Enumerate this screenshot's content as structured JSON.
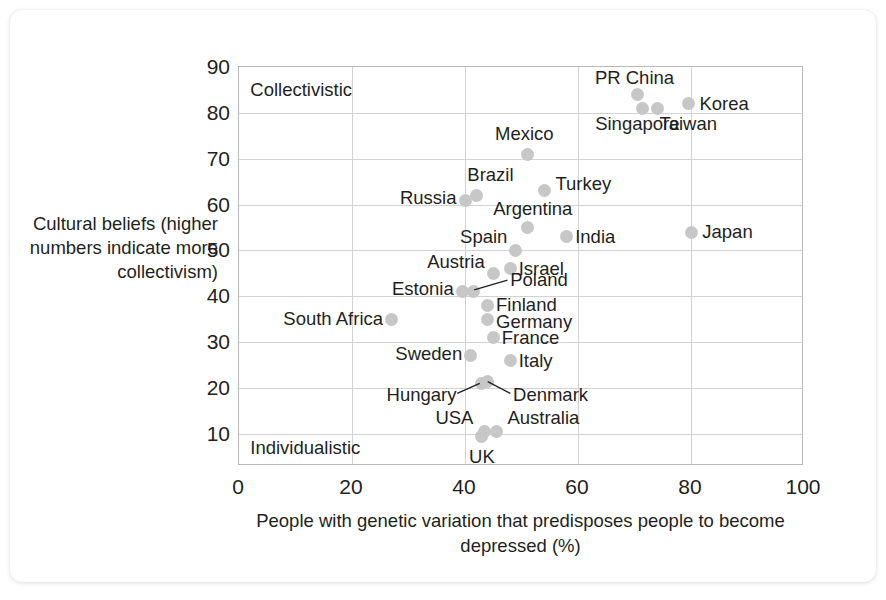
{
  "chart_data": {
    "type": "scatter",
    "title": "",
    "xlabel": "People with genetic variation that predisposes people to become depressed (%)",
    "ylabel": "Cultural beliefs (higher numbers indicate more collectivism)",
    "xlim": [
      0,
      100
    ],
    "ylim": [
      3,
      90
    ],
    "xticks": [
      0,
      20,
      40,
      60,
      80,
      100
    ],
    "yticks": [
      10,
      20,
      30,
      40,
      50,
      60,
      70,
      80,
      90
    ],
    "grid": true,
    "legend": "none",
    "annotations": [
      {
        "text": "Collectivistic",
        "x": 2,
        "y": 85
      },
      {
        "text": "Individualistic",
        "x": 2,
        "y": 7
      }
    ],
    "points": [
      {
        "name": "PR China",
        "x": 70.5,
        "y": 84.0
      },
      {
        "name": "Singapore",
        "x": 71.5,
        "y": 81.0
      },
      {
        "name": "Taiwan",
        "x": 74.0,
        "y": 81.0
      },
      {
        "name": "Korea",
        "x": 79.5,
        "y": 82.0
      },
      {
        "name": "Mexico",
        "x": 51.0,
        "y": 71.0
      },
      {
        "name": "Turkey",
        "x": 54.0,
        "y": 63.0
      },
      {
        "name": "Brazil",
        "x": 42.0,
        "y": 62.0
      },
      {
        "name": "Russia",
        "x": 40.0,
        "y": 61.0
      },
      {
        "name": "Argentina",
        "x": 51.0,
        "y": 55.0
      },
      {
        "name": "Japan",
        "x": 80.0,
        "y": 54.0
      },
      {
        "name": "India",
        "x": 58.0,
        "y": 53.0
      },
      {
        "name": "Spain",
        "x": 49.0,
        "y": 50.0
      },
      {
        "name": "Israel",
        "x": 48.0,
        "y": 46.0
      },
      {
        "name": "Austria",
        "x": 45.0,
        "y": 45.0
      },
      {
        "name": "Estonia",
        "x": 39.5,
        "y": 41.0
      },
      {
        "name": "Poland",
        "x": 41.5,
        "y": 41.0
      },
      {
        "name": "Finland",
        "x": 44.0,
        "y": 38.0
      },
      {
        "name": "Germany",
        "x": 44.0,
        "y": 35.0
      },
      {
        "name": "South Africa",
        "x": 27.0,
        "y": 35.0
      },
      {
        "name": "France",
        "x": 45.0,
        "y": 31.0
      },
      {
        "name": "Sweden",
        "x": 41.0,
        "y": 27.0
      },
      {
        "name": "Italy",
        "x": 48.0,
        "y": 26.0
      },
      {
        "name": "Hungary",
        "x": 43.0,
        "y": 21.0
      },
      {
        "name": "Denmark",
        "x": 44.0,
        "y": 21.5
      },
      {
        "name": "USA",
        "x": 43.5,
        "y": 10.5
      },
      {
        "name": "UK",
        "x": 43.0,
        "y": 9.5
      },
      {
        "name": "Australia",
        "x": 45.5,
        "y": 10.5
      }
    ],
    "point_labels": [
      {
        "name": "PR China",
        "text": "PR China",
        "x": 70.0,
        "y": 87.5,
        "anchor": "middle"
      },
      {
        "name": "Korea",
        "text": "Korea",
        "x": 81.5,
        "y": 82.0,
        "anchor": "start"
      },
      {
        "name": "Singapore",
        "text": "Singapore",
        "x": 70.5,
        "y": 77.5,
        "anchor": "middle"
      },
      {
        "name": "Taiwan",
        "text": "Taiwan",
        "x": 79.5,
        "y": 77.5,
        "anchor": "middle"
      },
      {
        "name": "Mexico",
        "text": "Mexico",
        "x": 50.5,
        "y": 75.5,
        "anchor": "middle"
      },
      {
        "name": "Brazil",
        "text": "Brazil",
        "x": 44.5,
        "y": 66.5,
        "anchor": "middle"
      },
      {
        "name": "Turkey",
        "text": "Turkey",
        "x": 56.0,
        "y": 64.5,
        "anchor": "start"
      },
      {
        "name": "Russia",
        "text": "Russia",
        "x": 38.5,
        "y": 61.5,
        "anchor": "end"
      },
      {
        "name": "Argentina",
        "text": "Argentina",
        "x": 52.0,
        "y": 59.0,
        "anchor": "middle"
      },
      {
        "name": "Japan",
        "text": "Japan",
        "x": 82.0,
        "y": 54.0,
        "anchor": "start"
      },
      {
        "name": "India",
        "text": "India",
        "x": 59.5,
        "y": 53.0,
        "anchor": "start"
      },
      {
        "name": "Spain",
        "text": "Spain",
        "x": 47.5,
        "y": 53.0,
        "anchor": "end"
      },
      {
        "name": "Israel",
        "text": "Israel",
        "x": 49.5,
        "y": 46.0,
        "anchor": "start"
      },
      {
        "name": "Austria",
        "text": "Austria",
        "x": 43.5,
        "y": 47.5,
        "anchor": "end"
      },
      {
        "name": "Poland",
        "text": "Poland",
        "x": 48.0,
        "y": 43.5,
        "anchor": "start"
      },
      {
        "name": "Estonia",
        "text": "Estonia",
        "x": 38.0,
        "y": 41.5,
        "anchor": "end"
      },
      {
        "name": "Finland",
        "text": "Finland",
        "x": 45.5,
        "y": 38.0,
        "anchor": "start"
      },
      {
        "name": "Germany",
        "text": "Germany",
        "x": 45.5,
        "y": 34.5,
        "anchor": "start"
      },
      {
        "name": "South Africa",
        "text": "South Africa",
        "x": 25.5,
        "y": 35.0,
        "anchor": "end"
      },
      {
        "name": "France",
        "text": "France",
        "x": 46.5,
        "y": 31.0,
        "anchor": "start"
      },
      {
        "name": "Sweden",
        "text": "Sweden",
        "x": 39.5,
        "y": 27.5,
        "anchor": "end"
      },
      {
        "name": "Italy",
        "text": "Italy",
        "x": 49.5,
        "y": 26.0,
        "anchor": "start"
      },
      {
        "name": "Hungary",
        "text": "Hungary",
        "x": 38.5,
        "y": 18.5,
        "anchor": "end"
      },
      {
        "name": "Denmark",
        "text": "Denmark",
        "x": 48.5,
        "y": 18.5,
        "anchor": "start"
      },
      {
        "name": "USA",
        "text": "USA",
        "x": 41.5,
        "y": 13.5,
        "anchor": "end"
      },
      {
        "name": "Australia",
        "text": "Australia",
        "x": 47.5,
        "y": 13.5,
        "anchor": "start"
      },
      {
        "name": "UK",
        "text": "UK",
        "x": 43.0,
        "y": 5.0,
        "anchor": "middle"
      }
    ],
    "leader_lines": [
      {
        "name": "poland-leader",
        "x1": 47.7,
        "y1": 43.3,
        "x2": 41.8,
        "y2": 41.2
      },
      {
        "name": "hungary-leader",
        "x1": 38.8,
        "y1": 18.6,
        "x2": 42.8,
        "y2": 20.8
      },
      {
        "name": "denmark-leader",
        "x1": 48.2,
        "y1": 18.6,
        "x2": 44.2,
        "y2": 21.2
      }
    ],
    "colors": {
      "dot": "#c7c7c7",
      "text": "#231f20",
      "grid": "#d2d2d2",
      "frame": "#b9b9b9",
      "background": "#ffffff"
    }
  }
}
